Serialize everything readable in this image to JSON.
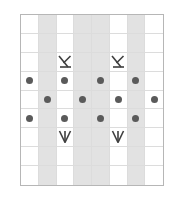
{
  "chart_data": {
    "type": "table",
    "title": "",
    "xlabel": "",
    "ylabel": "",
    "columns": 8,
    "rows": 9,
    "grid": true,
    "legend_position": "none",
    "row_labels_left": [
      "8",
      "6",
      "4",
      "2"
    ],
    "row_labels_right": [
      "9",
      "7",
      "5",
      "3",
      "1"
    ],
    "row_label_left_rows": [
      8,
      6,
      4,
      2
    ],
    "row_label_right_rows": [
      9,
      7,
      5,
      3,
      1
    ],
    "shaded_columns": [
      2,
      4,
      5,
      7
    ],
    "colors": {
      "shading": "#e2e2e2",
      "dot": "#5a5a5a",
      "symbol_stroke": "#3f3f3f",
      "gridline": "#dcdcdc",
      "border": "#b6b6b6",
      "label": "#9a9a9a",
      "background": "#ffffff"
    },
    "symbol_legend": {
      "dot": "purl-dot",
      "k-up": "left-leaning-decrease",
      "w-down": "double-decrease-arrow"
    },
    "cells": [
      {
        "row": 9,
        "col": 1,
        "symbol": ""
      },
      {
        "row": 9,
        "col": 2,
        "symbol": ""
      },
      {
        "row": 9,
        "col": 3,
        "symbol": ""
      },
      {
        "row": 9,
        "col": 4,
        "symbol": ""
      },
      {
        "row": 9,
        "col": 5,
        "symbol": ""
      },
      {
        "row": 9,
        "col": 6,
        "symbol": ""
      },
      {
        "row": 9,
        "col": 7,
        "symbol": ""
      },
      {
        "row": 9,
        "col": 8,
        "symbol": ""
      },
      {
        "row": 8,
        "col": 1,
        "symbol": ""
      },
      {
        "row": 8,
        "col": 2,
        "symbol": ""
      },
      {
        "row": 8,
        "col": 3,
        "symbol": ""
      },
      {
        "row": 8,
        "col": 4,
        "symbol": ""
      },
      {
        "row": 8,
        "col": 5,
        "symbol": ""
      },
      {
        "row": 8,
        "col": 6,
        "symbol": ""
      },
      {
        "row": 8,
        "col": 7,
        "symbol": ""
      },
      {
        "row": 8,
        "col": 8,
        "symbol": ""
      },
      {
        "row": 7,
        "col": 1,
        "symbol": ""
      },
      {
        "row": 7,
        "col": 2,
        "symbol": ""
      },
      {
        "row": 7,
        "col": 3,
        "symbol": "k-up"
      },
      {
        "row": 7,
        "col": 4,
        "symbol": ""
      },
      {
        "row": 7,
        "col": 5,
        "symbol": ""
      },
      {
        "row": 7,
        "col": 6,
        "symbol": "k-up"
      },
      {
        "row": 7,
        "col": 7,
        "symbol": ""
      },
      {
        "row": 7,
        "col": 8,
        "symbol": ""
      },
      {
        "row": 6,
        "col": 1,
        "symbol": "dot"
      },
      {
        "row": 6,
        "col": 2,
        "symbol": ""
      },
      {
        "row": 6,
        "col": 3,
        "symbol": "dot"
      },
      {
        "row": 6,
        "col": 4,
        "symbol": ""
      },
      {
        "row": 6,
        "col": 5,
        "symbol": "dot"
      },
      {
        "row": 6,
        "col": 6,
        "symbol": ""
      },
      {
        "row": 6,
        "col": 7,
        "symbol": "dot"
      },
      {
        "row": 6,
        "col": 8,
        "symbol": ""
      },
      {
        "row": 5,
        "col": 1,
        "symbol": ""
      },
      {
        "row": 5,
        "col": 2,
        "symbol": "dot"
      },
      {
        "row": 5,
        "col": 3,
        "symbol": ""
      },
      {
        "row": 5,
        "col": 4,
        "symbol": "dot"
      },
      {
        "row": 5,
        "col": 5,
        "symbol": ""
      },
      {
        "row": 5,
        "col": 6,
        "symbol": "dot"
      },
      {
        "row": 5,
        "col": 7,
        "symbol": ""
      },
      {
        "row": 5,
        "col": 8,
        "symbol": "dot"
      },
      {
        "row": 4,
        "col": 1,
        "symbol": "dot"
      },
      {
        "row": 4,
        "col": 2,
        "symbol": ""
      },
      {
        "row": 4,
        "col": 3,
        "symbol": "dot"
      },
      {
        "row": 4,
        "col": 4,
        "symbol": ""
      },
      {
        "row": 4,
        "col": 5,
        "symbol": "dot"
      },
      {
        "row": 4,
        "col": 6,
        "symbol": ""
      },
      {
        "row": 4,
        "col": 7,
        "symbol": "dot"
      },
      {
        "row": 4,
        "col": 8,
        "symbol": ""
      },
      {
        "row": 3,
        "col": 1,
        "symbol": ""
      },
      {
        "row": 3,
        "col": 2,
        "symbol": ""
      },
      {
        "row": 3,
        "col": 3,
        "symbol": "w-down"
      },
      {
        "row": 3,
        "col": 4,
        "symbol": ""
      },
      {
        "row": 3,
        "col": 5,
        "symbol": ""
      },
      {
        "row": 3,
        "col": 6,
        "symbol": "w-down"
      },
      {
        "row": 3,
        "col": 7,
        "symbol": ""
      },
      {
        "row": 3,
        "col": 8,
        "symbol": ""
      },
      {
        "row": 2,
        "col": 1,
        "symbol": ""
      },
      {
        "row": 2,
        "col": 2,
        "symbol": ""
      },
      {
        "row": 2,
        "col": 3,
        "symbol": ""
      },
      {
        "row": 2,
        "col": 4,
        "symbol": ""
      },
      {
        "row": 2,
        "col": 5,
        "symbol": ""
      },
      {
        "row": 2,
        "col": 6,
        "symbol": ""
      },
      {
        "row": 2,
        "col": 7,
        "symbol": ""
      },
      {
        "row": 2,
        "col": 8,
        "symbol": ""
      },
      {
        "row": 1,
        "col": 1,
        "symbol": ""
      },
      {
        "row": 1,
        "col": 2,
        "symbol": ""
      },
      {
        "row": 1,
        "col": 3,
        "symbol": ""
      },
      {
        "row": 1,
        "col": 4,
        "symbol": ""
      },
      {
        "row": 1,
        "col": 5,
        "symbol": ""
      },
      {
        "row": 1,
        "col": 6,
        "symbol": ""
      },
      {
        "row": 1,
        "col": 7,
        "symbol": ""
      },
      {
        "row": 1,
        "col": 8,
        "symbol": ""
      }
    ]
  }
}
